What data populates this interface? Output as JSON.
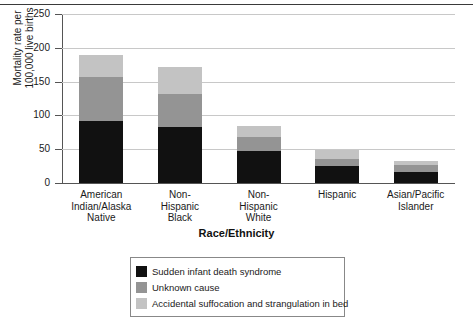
{
  "chart_data": {
    "type": "bar",
    "stacked": true,
    "title": "",
    "xlabel": "Race/Ethnicity",
    "ylabel": "Mortality rate per 100,000 live births",
    "ylabel_line1": "Mortality rate per",
    "ylabel_line2": "100,000 live births",
    "ylim": [
      0,
      250
    ],
    "yticks": [
      0,
      50,
      100,
      150,
      200,
      250
    ],
    "grid": true,
    "legend_position": "bottom",
    "categories": [
      "American Indian/Alaska Native",
      "Non-Hispanic Black",
      "Non-Hispanic White",
      "Hispanic",
      "Asian/Pacific Islander"
    ],
    "category_lines": [
      [
        "American",
        "Indian/Alaska",
        "Native"
      ],
      [
        "Non-",
        "Hispanic",
        "Black"
      ],
      [
        "Non-",
        "Hispanic",
        "White"
      ],
      [
        "Hispanic"
      ],
      [
        "Asian/Pacific",
        "Islander"
      ]
    ],
    "series": [
      {
        "name": "Sudden infant death syndrome",
        "color": "#111111",
        "values": [
          91,
          83,
          47,
          25,
          17
        ]
      },
      {
        "name": "Unknown cause",
        "color": "#949494",
        "values": [
          66,
          49,
          21,
          10,
          9
        ]
      },
      {
        "name": "Accidental suffocation and strangulation in bed",
        "color": "#c3c3c3",
        "values": [
          33,
          39,
          17,
          14,
          6
        ]
      }
    ],
    "totals": [
      190,
      171,
      85,
      49,
      32
    ]
  },
  "legend": {
    "items": [
      {
        "label": "Sudden infant death syndrome",
        "color": "#111111"
      },
      {
        "label": "Unknown cause",
        "color": "#949494"
      },
      {
        "label": "Accidental suffocation and strangulation in bed",
        "color": "#c3c3c3"
      }
    ]
  },
  "axis": {
    "y_tick_labels": [
      "250",
      "200",
      "150",
      "100",
      "50",
      "0"
    ]
  }
}
